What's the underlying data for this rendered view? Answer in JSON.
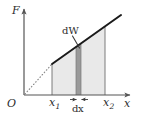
{
  "figure": {
    "axes": {
      "y_label": "F",
      "x_label": "x",
      "origin_label": "O"
    },
    "tick_labels": {
      "x1": {
        "base": "x",
        "sub": "1"
      },
      "x2": {
        "base": "x",
        "sub": "2"
      }
    },
    "annotations": {
      "work_element": {
        "prefix": "d",
        "var": "W"
      },
      "width_element": {
        "prefix": "d",
        "var": "x"
      }
    },
    "colors": {
      "background": "#ffffff",
      "axis": "#555555",
      "curve": "#1a1a1a",
      "dotted_extension": "#8a8a8a",
      "area_fill": "#e9e9e9",
      "strip_fill": "#9a9a9a",
      "strip_edge": "#7a7a7a",
      "text": "#2b2b2b",
      "leader": "#3a3a3a"
    },
    "geometry": {
      "origin": {
        "x": 24,
        "y": 95
      },
      "y_axis_top": {
        "x": 24,
        "y": 6
      },
      "x_axis_right": {
        "x": 133,
        "y": 95
      },
      "curve_start": {
        "x": 52,
        "y": 64
      },
      "curve_end": {
        "x": 121,
        "y": 15
      },
      "x1_line_x": 52,
      "x2_line_x": 105,
      "strip_left_x": 76,
      "strip_right_x": 81
    }
  }
}
